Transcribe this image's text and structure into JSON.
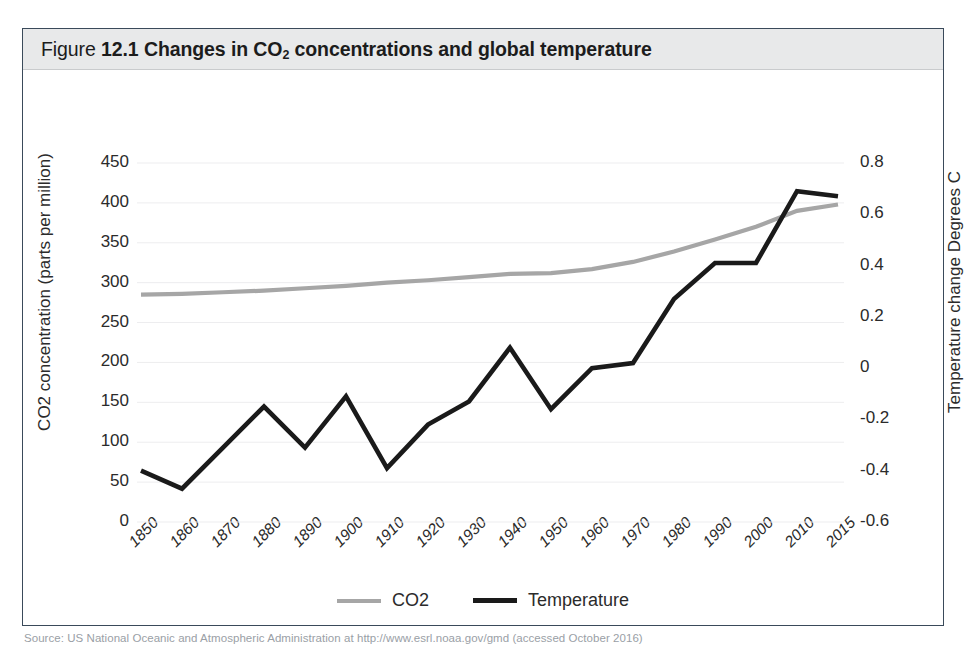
{
  "figure": {
    "label": "Figure",
    "number": "12.1",
    "title_rest_before_sub": "Changes in CO",
    "title_sub": "2",
    "title_rest_after_sub": " concentrations and global temperature",
    "title_plain": "Figure 12.1 Changes in CO2 concentrations and global temperature",
    "frame_border_color": "#3a4a5a",
    "title_band_color": "#e8e9ea"
  },
  "source": {
    "label": "Source:",
    "text": "Source: US National Oceanic and Atmospheric Administration at http://www.esrl.noaa.gov/gmd (accessed October 2016)"
  },
  "legend": {
    "position": "bottom-center",
    "entries": [
      {
        "label": "CO2",
        "color": "#a6a6a6"
      },
      {
        "label": "Temperature",
        "color": "#1a1a1a"
      }
    ]
  },
  "chart_data": {
    "type": "line",
    "title": "Changes in CO2 concentrations and global temperature",
    "xlabel": "",
    "grid": true,
    "grid_axis": "y-left",
    "categories": [
      "1850",
      "1860",
      "1870",
      "1880",
      "1890",
      "1900",
      "1910",
      "1920",
      "1930",
      "1940",
      "1950",
      "1960",
      "1970",
      "1980",
      "1990",
      "2000",
      "2010",
      "2015"
    ],
    "axes": {
      "left": {
        "label": "CO2 concentration (parts per million)",
        "ticks": [
          0,
          50,
          100,
          150,
          200,
          250,
          300,
          350,
          400,
          450
        ],
        "tick_labels": [
          "0",
          "50",
          "100",
          "150",
          "200",
          "250",
          "300",
          "350",
          "400",
          "450"
        ],
        "lim": [
          0,
          450
        ]
      },
      "right": {
        "label": "Temperature change Degrees C",
        "ticks": [
          -0.6,
          -0.4,
          -0.2,
          0,
          0.2,
          0.4,
          0.6,
          0.8
        ],
        "tick_labels": [
          "-0.6",
          "-0.4",
          "-0.2",
          "0",
          "0.2",
          "0.4",
          "0.6",
          "0.8"
        ],
        "lim": [
          -0.6,
          0.8
        ]
      }
    },
    "series": [
      {
        "name": "CO2",
        "axis": "left",
        "color": "#a6a6a6",
        "unit": "parts per million",
        "values": [
          285,
          286,
          288,
          290,
          293,
          296,
          300,
          303,
          307,
          311,
          312,
          317,
          326,
          339,
          354,
          370,
          390,
          398
        ]
      },
      {
        "name": "Temperature",
        "axis": "right",
        "color": "#1a1a1a",
        "unit": "Degrees C",
        "values": [
          -0.4,
          -0.47,
          -0.31,
          -0.15,
          -0.31,
          -0.11,
          -0.39,
          -0.22,
          -0.13,
          0.08,
          -0.16,
          0.0,
          0.02,
          0.27,
          0.41,
          0.41,
          0.69,
          0.67
        ]
      }
    ]
  }
}
